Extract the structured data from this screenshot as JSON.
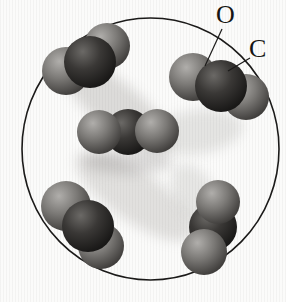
{
  "diagram": {
    "labels": {
      "oxygen": "O",
      "carbon": "C"
    },
    "colors": {
      "outline": "#1b1a19",
      "leader_line": "#1b1a19",
      "background": "#fbfbfa",
      "oxygen": {
        "hi": "#b0aeab",
        "mid": "#7b7976",
        "dark": "#403e3c",
        "edge": "#242320"
      },
      "carbon": {
        "hi": "#6b6966",
        "mid": "#3a3836",
        "dark": "#1a1918",
        "edge": "#0d0c0b"
      }
    },
    "container": {
      "cx": 150.5,
      "cy": 149,
      "rx": 128.5,
      "ry": 131,
      "stroke_width": 1.6
    },
    "molecules": [
      {
        "name": "top-left",
        "formula": "CO2",
        "atoms": [
          {
            "element": "O",
            "x": 66,
            "y": 71,
            "r": 24,
            "z": 1
          },
          {
            "element": "O",
            "x": 107,
            "y": 46,
            "r": 23,
            "z": 1
          },
          {
            "element": "C",
            "x": 90,
            "y": 62,
            "r": 26,
            "z": 2
          }
        ]
      },
      {
        "name": "top-right",
        "formula": "CO2",
        "atoms": [
          {
            "element": "O",
            "x": 193,
            "y": 77,
            "r": 24,
            "z": 1
          },
          {
            "element": "O",
            "x": 246,
            "y": 97,
            "r": 23,
            "z": 1
          },
          {
            "element": "C",
            "x": 221,
            "y": 86,
            "r": 26,
            "z": 2
          }
        ]
      },
      {
        "name": "middle",
        "formula": "CO2",
        "atoms": [
          {
            "element": "C",
            "x": 128,
            "y": 132,
            "r": 23,
            "z": 1
          },
          {
            "element": "O",
            "x": 99,
            "y": 132,
            "r": 22,
            "z": 2
          },
          {
            "element": "O",
            "x": 157,
            "y": 131,
            "r": 22,
            "z": 2
          }
        ]
      },
      {
        "name": "bottom-left",
        "formula": "CO2",
        "atoms": [
          {
            "element": "O",
            "x": 101,
            "y": 246,
            "r": 23,
            "z": 1
          },
          {
            "element": "O",
            "x": 66,
            "y": 206,
            "r": 25,
            "z": 1
          },
          {
            "element": "C",
            "x": 88,
            "y": 226,
            "r": 26,
            "z": 2
          }
        ]
      },
      {
        "name": "bottom-right",
        "formula": "CO2",
        "atoms": [
          {
            "element": "C",
            "x": 213,
            "y": 227,
            "r": 24,
            "z": 1
          },
          {
            "element": "O",
            "x": 218,
            "y": 202,
            "r": 22,
            "z": 2
          },
          {
            "element": "O",
            "x": 204,
            "y": 252,
            "r": 23,
            "z": 2
          }
        ]
      }
    ],
    "leader_lines": {
      "oxygen": {
        "x1": 222,
        "y1": 29,
        "x2": 205,
        "y2": 66
      },
      "carbon": {
        "x1": 250,
        "y1": 58,
        "x2": 228,
        "y2": 71
      }
    }
  }
}
